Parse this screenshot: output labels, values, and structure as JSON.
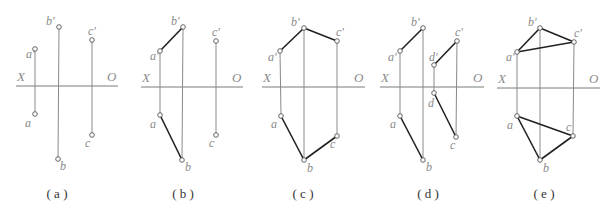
{
  "figure": {
    "colors": {
      "axis": "#7a7a7a",
      "projection_line": "#8a8a8a",
      "edge": "#222222",
      "label": "#8a8a8a",
      "caption": "#333333"
    },
    "axis_labels": {
      "left": "X",
      "right": "O"
    },
    "panels": [
      {
        "id": "a",
        "caption": "( a )",
        "caption_x": 57,
        "axis": {
          "x1": 16,
          "x2": 118,
          "y": 86
        },
        "points": [
          {
            "name": "a'",
            "x": 35,
            "y": 49,
            "lx": 26,
            "ly": 58
          },
          {
            "name": "b'",
            "x": 59,
            "y": 27,
            "lx": 46,
            "ly": 25
          },
          {
            "name": "c'",
            "x": 92,
            "y": 40,
            "lx": 88,
            "ly": 35
          },
          {
            "name": "a",
            "x": 35,
            "y": 114,
            "lx": 25,
            "ly": 127
          },
          {
            "name": "b",
            "x": 58,
            "y": 159,
            "lx": 60,
            "ly": 170
          },
          {
            "name": "c",
            "x": 92,
            "y": 135,
            "lx": 85,
            "ly": 147
          }
        ],
        "projections": [
          [
            "a'",
            "a"
          ],
          [
            "b'",
            "b"
          ],
          [
            "c'",
            "c"
          ]
        ],
        "edges": []
      },
      {
        "id": "b",
        "caption": "( b )",
        "caption_x": 183,
        "axis": {
          "x1": 141,
          "x2": 243,
          "y": 87
        },
        "points": [
          {
            "name": "a'",
            "x": 160,
            "y": 51,
            "lx": 150,
            "ly": 60
          },
          {
            "name": "b'",
            "x": 183,
            "y": 27,
            "lx": 171,
            "ly": 25
          },
          {
            "name": "c'",
            "x": 216,
            "y": 41,
            "lx": 212,
            "ly": 36
          },
          {
            "name": "a",
            "x": 160,
            "y": 115,
            "lx": 150,
            "ly": 128
          },
          {
            "name": "b",
            "x": 182,
            "y": 160,
            "lx": 185,
            "ly": 171
          },
          {
            "name": "c",
            "x": 216,
            "y": 135,
            "lx": 209,
            "ly": 147
          }
        ],
        "projections": [
          [
            "a'",
            "a"
          ],
          [
            "b'",
            "b"
          ],
          [
            "c'",
            "c"
          ]
        ],
        "edges": [
          [
            "a'",
            "b'"
          ],
          [
            "a",
            "b"
          ]
        ]
      },
      {
        "id": "c",
        "caption": "( c )",
        "caption_x": 303,
        "axis": {
          "x1": 262,
          "x2": 365,
          "y": 87
        },
        "points": [
          {
            "name": "a'",
            "x": 280,
            "y": 51,
            "lx": 268,
            "ly": 61
          },
          {
            "name": "b'",
            "x": 304,
            "y": 28,
            "lx": 291,
            "ly": 26
          },
          {
            "name": "c'",
            "x": 337,
            "y": 41,
            "lx": 336,
            "ly": 36
          },
          {
            "name": "a",
            "x": 281,
            "y": 116,
            "lx": 271,
            "ly": 128
          },
          {
            "name": "b",
            "x": 304,
            "y": 160,
            "lx": 307,
            "ly": 172
          },
          {
            "name": "c",
            "x": 337,
            "y": 136,
            "lx": 330,
            "ly": 148
          }
        ],
        "projections": [
          [
            "a'",
            "a"
          ],
          [
            "b'",
            "b"
          ],
          [
            "c'",
            "c"
          ]
        ],
        "edges": [
          [
            "a'",
            "b'"
          ],
          [
            "b'",
            "c'"
          ],
          [
            "a",
            "b"
          ],
          [
            "b",
            "c"
          ]
        ]
      },
      {
        "id": "d",
        "caption": "( d )",
        "caption_x": 428,
        "axis": {
          "x1": 380,
          "x2": 484,
          "y": 87
        },
        "points": [
          {
            "name": "a'",
            "x": 400,
            "y": 51,
            "lx": 388,
            "ly": 61
          },
          {
            "name": "b'",
            "x": 423,
            "y": 28,
            "lx": 411,
            "ly": 26
          },
          {
            "name": "c'",
            "x": 457,
            "y": 41,
            "lx": 455,
            "ly": 36
          },
          {
            "name": "d'",
            "x": 434,
            "y": 65,
            "lx": 429,
            "ly": 61
          },
          {
            "name": "a",
            "x": 400,
            "y": 116,
            "lx": 390,
            "ly": 128
          },
          {
            "name": "b",
            "x": 423,
            "y": 160,
            "lx": 426,
            "ly": 171
          },
          {
            "name": "c",
            "x": 456,
            "y": 137,
            "lx": 450,
            "ly": 149
          },
          {
            "name": "d",
            "x": 434,
            "y": 93,
            "lx": 428,
            "ly": 107
          }
        ],
        "projections": [
          [
            "a'",
            "a"
          ],
          [
            "b'",
            "b"
          ],
          [
            "c'",
            "c"
          ],
          [
            "d'",
            "d"
          ]
        ],
        "edges": [
          [
            "a'",
            "b'"
          ],
          [
            "a",
            "b"
          ],
          [
            "d'",
            "c'"
          ],
          [
            "d",
            "c"
          ]
        ]
      },
      {
        "id": "e",
        "caption": "( e )",
        "caption_x": 544,
        "axis": {
          "x1": 497,
          "x2": 600,
          "y": 88
        },
        "points": [
          {
            "name": "a'",
            "x": 517,
            "y": 52,
            "lx": 506,
            "ly": 61
          },
          {
            "name": "b'",
            "x": 540,
            "y": 28,
            "lx": 528,
            "ly": 26
          },
          {
            "name": "c'",
            "x": 574,
            "y": 42,
            "lx": 574,
            "ly": 37
          },
          {
            "name": "a",
            "x": 517,
            "y": 116,
            "lx": 507,
            "ly": 129
          },
          {
            "name": "b",
            "x": 540,
            "y": 160,
            "lx": 543,
            "ly": 172
          },
          {
            "name": "c",
            "x": 573,
            "y": 136,
            "lx": 566,
            "ly": 131
          }
        ],
        "projections": [
          [
            "a'",
            "a"
          ],
          [
            "b'",
            "b"
          ],
          [
            "c'",
            "c"
          ]
        ],
        "edges": [
          [
            "a'",
            "b'"
          ],
          [
            "b'",
            "c'"
          ],
          [
            "c'",
            "a'"
          ],
          [
            "a",
            "b"
          ],
          [
            "b",
            "c"
          ],
          [
            "c",
            "a"
          ]
        ]
      }
    ]
  }
}
